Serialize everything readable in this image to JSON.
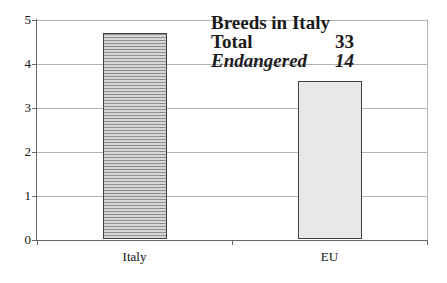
{
  "chart_data": {
    "type": "bar",
    "categories": [
      "Italy",
      "EU"
    ],
    "values": [
      4.7,
      3.6
    ],
    "title": "Breeds in Italy",
    "xlabel": "",
    "ylabel": "",
    "ylim": [
      0,
      5
    ],
    "yticks": [
      0,
      1,
      2,
      3,
      4,
      5
    ],
    "grid": true,
    "legend": "none",
    "annotation": {
      "title": "Breeds in Italy",
      "rows": [
        {
          "label": "Total",
          "value": "33"
        },
        {
          "label": "Endangered",
          "value": "14"
        }
      ]
    },
    "bar_patterns": [
      "horizontal-hatch",
      "solid"
    ],
    "colors": {
      "hatch_dark": "#8f8f8f",
      "hatch_light": "#d6d6d6",
      "eu_fill": "#e8e8e8",
      "bar_border": "#404040",
      "gridline": "#b3b3b3",
      "axis": "#666666",
      "text": "#1a1a1a"
    }
  }
}
